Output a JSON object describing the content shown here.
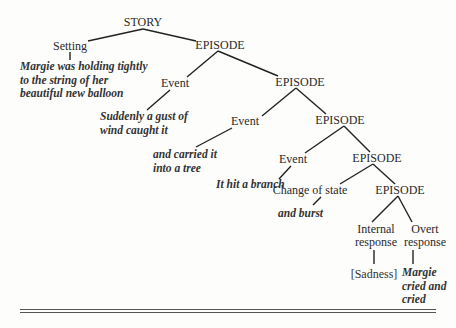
{
  "diagram": {
    "root": "STORY",
    "nodes": {
      "story": "STORY",
      "setting": "Setting",
      "episode1": "EPISODE",
      "event1": "Event",
      "episode2": "EPISODE",
      "event2": "Event",
      "episode3": "EPISODE",
      "event3": "Event",
      "episode4": "EPISODE",
      "change_of_state": "Change of state",
      "episode5": "EPISODE",
      "internal_response": [
        "Internal",
        "response"
      ],
      "overt_response": [
        "Overt",
        "response"
      ]
    },
    "leaves": {
      "setting": [
        "Margie was holding tightly",
        "to the string of her",
        "beautiful new balloon"
      ],
      "event1": [
        "Suddenly a gust of",
        "wind caught it"
      ],
      "event2": [
        "and carried it",
        "into a tree"
      ],
      "event3": [
        "It hit a branch"
      ],
      "change_of_state": [
        "and burst"
      ],
      "internal_response": [
        "[Sadness]"
      ],
      "overt_response": [
        "Margie",
        "cried and",
        "cried"
      ]
    }
  }
}
